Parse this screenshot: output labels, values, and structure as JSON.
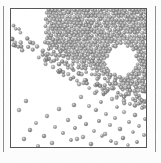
{
  "figure": {
    "kind": "particle-simulation-snapshot",
    "caption": "",
    "panel_background": "#fcfcfc",
    "container": {
      "x": 10,
      "y": 8,
      "width": 137,
      "height": 140,
      "border_color": "#555555",
      "border_width": 1,
      "fill_color": "#ffffff"
    },
    "neighbor_rules": [
      {
        "name": "left-panel-rule",
        "x": 3,
        "y": 6,
        "height": 146,
        "color": "#8d8d8d"
      },
      {
        "name": "right-panel-rule",
        "x": 155,
        "y": 6,
        "height": 146,
        "color": "#8d8d8d"
      }
    ]
  },
  "chart_data": {
    "type": "scatter",
    "title": "",
    "subtitle": "",
    "xlabel": "",
    "ylabel": "",
    "xlim": [
      0,
      137
    ],
    "ylim": [
      0,
      140
    ],
    "grid": false,
    "legend": null,
    "annotations": [],
    "particle": {
      "shape": "sphere",
      "diameter_px": 3.6,
      "fill_color": "#9a9a9a",
      "edge_color": "#6a6a6a",
      "highlight_color": "#e6e6e6"
    },
    "regions": [
      {
        "name": "dense-packing",
        "fill_fraction": 0.82,
        "count": 1050,
        "bounds": {
          "x0": 0,
          "y0": 0,
          "x1": 137,
          "y1": 95
        },
        "interface_slope": "upper-left to lower-right"
      },
      {
        "name": "cavity",
        "fill_fraction": 0.0,
        "count": 0,
        "bounds": {
          "x0": 96,
          "y0": 36,
          "x1": 126,
          "y1": 66
        }
      },
      {
        "name": "dilute-scatter",
        "fill_fraction": 0.03,
        "count": 58,
        "bounds": {
          "x0": 0,
          "y0": 78,
          "x1": 137,
          "y1": 140
        }
      }
    ],
    "surface_profile": {
      "x": [
        0,
        14,
        28,
        42,
        56,
        70,
        84,
        98,
        112,
        126,
        137
      ],
      "y": [
        24,
        30,
        38,
        47,
        56,
        62,
        68,
        74,
        80,
        86,
        90
      ]
    },
    "left_edge_profile": {
      "x": [
        0,
        6,
        12,
        18,
        24,
        30
      ],
      "y": [
        18,
        22,
        27,
        33,
        40,
        48
      ]
    },
    "scatter_points": [
      [
        118,
        78
      ],
      [
        97,
        80
      ],
      [
        132,
        82
      ],
      [
        84,
        84
      ],
      [
        110,
        86
      ],
      [
        126,
        88
      ],
      [
        70,
        88
      ],
      [
        101,
        90
      ],
      [
        136,
        91
      ],
      [
        90,
        93
      ],
      [
        119,
        95
      ],
      [
        63,
        96
      ],
      [
        78,
        97
      ],
      [
        106,
        98
      ],
      [
        131,
        99
      ],
      [
        48,
        100
      ],
      [
        85,
        101
      ],
      [
        113,
        103
      ],
      [
        95,
        105
      ],
      [
        124,
        106
      ],
      [
        36,
        107
      ],
      [
        69,
        108
      ],
      [
        104,
        109
      ],
      [
        134,
        110
      ],
      [
        57,
        111
      ],
      [
        88,
        112
      ],
      [
        118,
        113
      ],
      [
        25,
        114
      ],
      [
        75,
        115
      ],
      [
        99,
        116
      ],
      [
        128,
        117
      ],
      [
        44,
        118
      ],
      [
        64,
        119
      ],
      [
        109,
        120
      ],
      [
        19,
        121
      ],
      [
        83,
        122
      ],
      [
        122,
        123
      ],
      [
        52,
        124
      ],
      [
        94,
        125
      ],
      [
        133,
        126
      ],
      [
        33,
        127
      ],
      [
        72,
        128
      ],
      [
        112,
        129
      ],
      [
        13,
        130
      ],
      [
        60,
        131
      ],
      [
        100,
        132
      ],
      [
        126,
        133
      ],
      [
        41,
        134
      ],
      [
        80,
        135
      ],
      [
        117,
        136
      ],
      [
        27,
        137
      ],
      [
        66,
        130
      ],
      [
        91,
        127
      ],
      [
        105,
        134
      ],
      [
        55,
        138
      ],
      [
        137,
        120
      ],
      [
        8,
        101
      ],
      [
        15,
        92
      ]
    ]
  }
}
